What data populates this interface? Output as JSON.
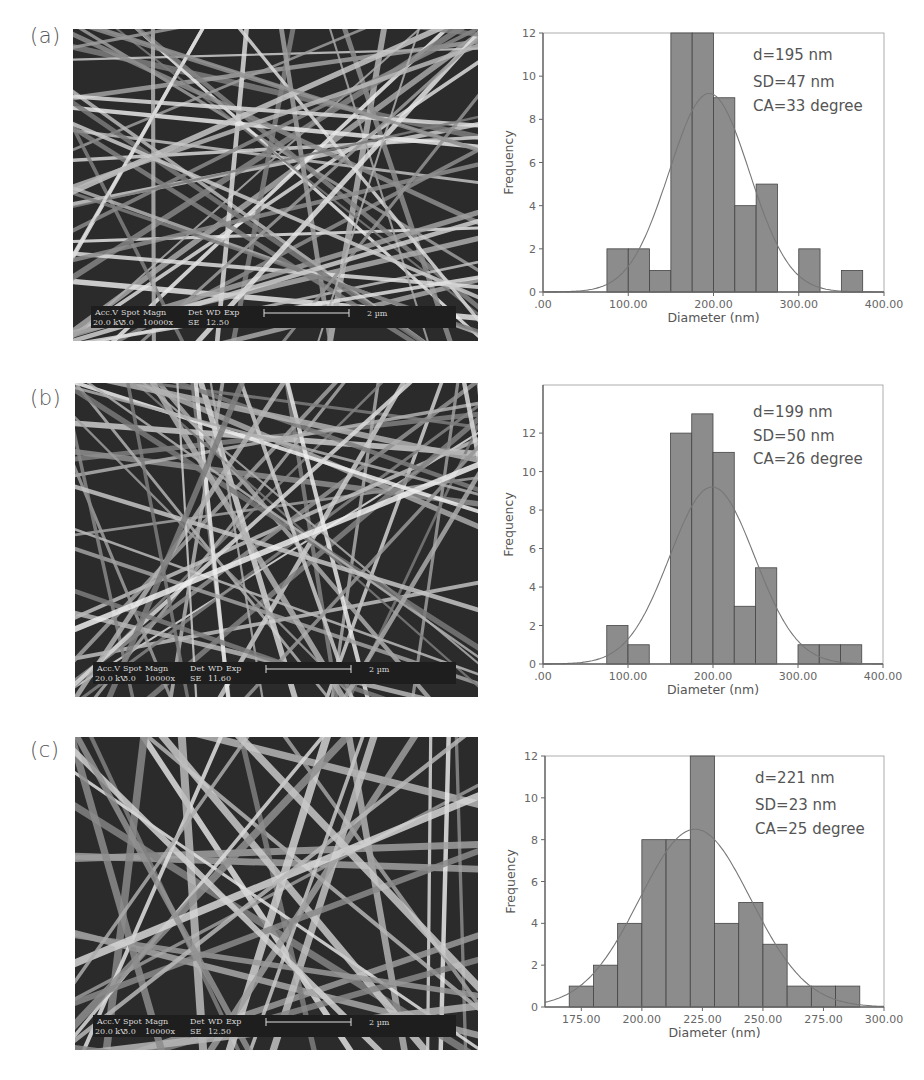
{
  "panels": [
    {
      "label": "(a)",
      "sem": {
        "infobar": {
          "headers": [
            "Acc.V",
            "Spot",
            "Magn",
            "Det",
            "WD",
            "Exp"
          ],
          "values": [
            "20.0 kV",
            "3.0",
            "10000x",
            "SE",
            "12.5",
            "0"
          ],
          "scale_bar": "2 µm"
        }
      },
      "stats": {
        "d": "d=195 nm",
        "sd": "SD=47 nm",
        "ca": "CA=33 degree"
      }
    },
    {
      "label": "(b)",
      "sem": {
        "infobar": {
          "headers": [
            "Acc.V",
            "Spot",
            "Magn",
            "Det",
            "WD",
            "Exp"
          ],
          "values": [
            "20.0 kV",
            "3.0",
            "10000x",
            "SE",
            "11.6",
            "0"
          ],
          "scale_bar": "2 µm"
        }
      },
      "stats": {
        "d": "d=199 nm",
        "sd": "SD=50 nm",
        "ca": "CA=26 degree"
      }
    },
    {
      "label": "(c)",
      "sem": {
        "infobar": {
          "headers": [
            "Acc.V",
            "Spot",
            "Magn",
            "Det",
            "WD",
            "Exp"
          ],
          "values": [
            "20.0 kV",
            "3.0",
            "10000x",
            "SE",
            "12.5",
            "0"
          ],
          "scale_bar": "2 µm"
        }
      },
      "stats": {
        "d": "d=221 nm",
        "sd": "SD=23 nm",
        "ca": "CA=25 degree"
      }
    }
  ],
  "colors": {
    "bar_fill": "#8c8c8c",
    "bar_edge": "#444444",
    "curve": "#777777",
    "axis": "#666666"
  },
  "chart_data": [
    {
      "type": "bar",
      "subtype": "histogram",
      "panel": "(a)",
      "xlabel": "Diameter (nm)",
      "ylabel": "Frequency",
      "xlim": [
        0,
        400
      ],
      "ylim": [
        0,
        12
      ],
      "xticks": [
        0,
        100,
        200,
        300,
        400
      ],
      "xtick_labels": [
        ".00",
        "100.00",
        "200.00",
        "300.00",
        "400.00"
      ],
      "yticks": [
        0,
        2,
        4,
        6,
        8,
        10,
        12
      ],
      "bin_edges": [
        75,
        100,
        125,
        150,
        175,
        200,
        225,
        250,
        275,
        300,
        325,
        350,
        375
      ],
      "values": [
        2,
        2,
        1,
        12,
        12,
        9,
        4,
        5,
        0,
        2,
        0,
        1
      ],
      "normal_fit": {
        "mean": 195,
        "sd": 47,
        "peak": 9.2
      },
      "annotations": [
        "d=195 nm",
        "SD=47 nm",
        "CA=33 degree"
      ],
      "grid": false,
      "legend": null
    },
    {
      "type": "bar",
      "subtype": "histogram",
      "panel": "(b)",
      "xlabel": "Diameter (nm)",
      "ylabel": "Frequency",
      "xlim": [
        0,
        400
      ],
      "ylim": [
        0,
        14.5
      ],
      "xticks": [
        0,
        100,
        200,
        300,
        400
      ],
      "xtick_labels": [
        ".00",
        "100.00",
        "200.00",
        "300.00",
        "400.00"
      ],
      "yticks": [
        0,
        2,
        4,
        6,
        8,
        10,
        12
      ],
      "bin_edges": [
        75,
        100,
        125,
        150,
        175,
        200,
        225,
        250,
        275,
        300,
        325,
        350,
        375
      ],
      "values": [
        2,
        1,
        0,
        12,
        13,
        11,
        3,
        5,
        0,
        1,
        1,
        1
      ],
      "normal_fit": {
        "mean": 199,
        "sd": 50,
        "peak": 9.2
      },
      "annotations": [
        "d=199 nm",
        "SD=50 nm",
        "CA=26 degree"
      ],
      "grid": false,
      "legend": null
    },
    {
      "type": "bar",
      "subtype": "histogram",
      "panel": "(c)",
      "xlabel": "Diameter (nm)",
      "ylabel": "Frequency",
      "xlim": [
        160,
        300
      ],
      "ylim": [
        0,
        12
      ],
      "xticks": [
        175,
        200,
        225,
        250,
        275,
        300
      ],
      "xtick_labels": [
        "175.00",
        "200.00",
        "225.00",
        "250.00",
        "275.00",
        "300.00"
      ],
      "yticks": [
        0,
        2,
        4,
        6,
        8,
        10,
        12
      ],
      "bin_edges": [
        170,
        180,
        190,
        200,
        210,
        220,
        230,
        240,
        250,
        260,
        270,
        280,
        290
      ],
      "values": [
        1,
        2,
        4,
        8,
        8,
        12,
        4,
        5,
        3,
        1,
        1,
        1
      ],
      "normal_fit": {
        "mean": 222,
        "sd": 23,
        "peak": 8.5
      },
      "annotations": [
        "d=221 nm",
        "SD=23 nm",
        "CA=25 degree"
      ],
      "grid": false,
      "legend": null
    }
  ]
}
